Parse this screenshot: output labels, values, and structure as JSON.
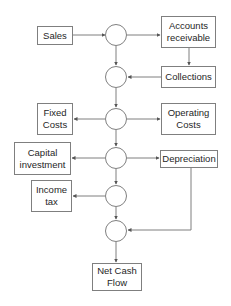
{
  "colors": {
    "stroke": "#7f7f7f",
    "text": "#262626",
    "background": "#ffffff"
  },
  "nodes": {
    "sales": "Sales",
    "accounts_receivable": "Accounts receivable",
    "collections": "Collections",
    "fixed_costs": "Fixed Costs",
    "operating_costs": "Operating Costs",
    "capital_investment": "Capital investment",
    "depreciation": "Depreciation",
    "income_tax": "Income tax",
    "net_cash_flow": "Net Cash Flow"
  },
  "junctions": [
    "j1",
    "j2",
    "j3",
    "j4",
    "j5",
    "j6"
  ],
  "edges": [
    {
      "from": "sales",
      "to": "j1"
    },
    {
      "from": "j1",
      "to": "accounts_receivable"
    },
    {
      "from": "accounts_receivable",
      "to": "collections"
    },
    {
      "from": "collections",
      "to": "j2"
    },
    {
      "from": "j1",
      "to": "j2"
    },
    {
      "from": "j2",
      "to": "j3"
    },
    {
      "from": "j3",
      "to": "fixed_costs"
    },
    {
      "from": "j3",
      "to": "operating_costs"
    },
    {
      "from": "j3",
      "to": "j4"
    },
    {
      "from": "j4",
      "to": "capital_investment"
    },
    {
      "from": "j4",
      "to": "depreciation"
    },
    {
      "from": "j4",
      "to": "j5"
    },
    {
      "from": "j5",
      "to": "income_tax"
    },
    {
      "from": "j5",
      "to": "j6"
    },
    {
      "from": "depreciation",
      "to": "j6"
    },
    {
      "from": "j6",
      "to": "net_cash_flow"
    }
  ]
}
